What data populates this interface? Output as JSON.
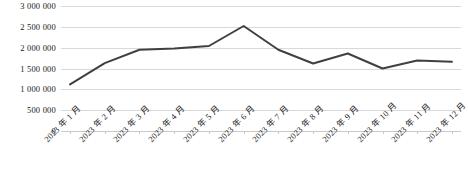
{
  "chart_data": {
    "type": "line",
    "title": "",
    "xlabel": "",
    "ylabel": "",
    "categories": [
      "2023 年 1 月",
      "2023 年 2 月",
      "2023 年 3 月",
      "2023 年 4 月",
      "2023 年 5 月",
      "2023 年 6 月",
      "2023 年 7 月",
      "2023 年 8 月",
      "2023 年 9 月",
      "2023 年 10 月",
      "2023 年 11 月",
      "2023 年 12 月"
    ],
    "values": [
      1120000,
      1630000,
      1950000,
      1980000,
      2040000,
      2520000,
      1950000,
      1620000,
      1860000,
      1500000,
      1690000,
      1660000
    ],
    "series": [
      {
        "name": "",
        "values": [
          1120000,
          1630000,
          1950000,
          1980000,
          2040000,
          2520000,
          1950000,
          1620000,
          1860000,
          1500000,
          1690000,
          1660000
        ]
      }
    ],
    "ylim": [
      0,
      3000000
    ],
    "ytick_values": [
      0,
      500000,
      1000000,
      1500000,
      2000000,
      2500000,
      3000000
    ],
    "ytick_labels": [
      "0",
      "500 000",
      "1 000 000",
      "1 500 000",
      "2 000 000",
      "2 500 000",
      "3 000 000"
    ],
    "grid": true,
    "grid_axis": "y",
    "legend": false,
    "legend_position": "none",
    "line_color": "#404040",
    "grid_color": "#d9d9d9",
    "background_color": "#ffffff",
    "line_width": 2,
    "markers": false,
    "xtick_label_rotation": -45
  }
}
